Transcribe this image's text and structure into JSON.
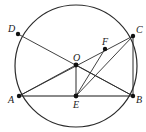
{
  "figure": {
    "canvas": {
      "width": 146,
      "height": 132
    },
    "colors": {
      "stroke": "#2b2b2b",
      "chord_ab": "#8a8a8a",
      "point_fill": "#111111",
      "label": "#1a1a1a",
      "background": "#ffffff"
    },
    "circle": {
      "name": "circumcircle",
      "cx": 76,
      "cy": 66,
      "r": 61,
      "stroke_width": 1.2
    },
    "points": [
      {
        "id": "D",
        "label": "D",
        "x": 18,
        "y": 34,
        "label_dx": -10,
        "label_dy": -10,
        "r": 2.2
      },
      {
        "id": "C",
        "label": "C",
        "x": 133,
        "y": 36,
        "label_dx": 3,
        "label_dy": -11,
        "r": 2.2
      },
      {
        "id": "F",
        "label": "F",
        "x": 105,
        "y": 49,
        "label_dx": -3,
        "label_dy": -12,
        "r": 2.2
      },
      {
        "id": "O",
        "label": "O",
        "x": 76,
        "y": 65,
        "label_dx": -3,
        "label_dy": -12,
        "r": 2.4
      },
      {
        "id": "A",
        "label": "A",
        "x": 19,
        "y": 96,
        "label_dx": -11,
        "label_dy": -1,
        "r": 2.2
      },
      {
        "id": "E",
        "label": "E",
        "x": 76,
        "y": 96,
        "label_dx": -3,
        "label_dy": 4,
        "r": 2.4
      },
      {
        "id": "B",
        "label": "B",
        "x": 133,
        "y": 96,
        "label_dx": 3,
        "label_dy": -1,
        "r": 2.2
      }
    ],
    "segments": [
      {
        "id": "AB",
        "name": "chord-a-b",
        "x1": 19,
        "y1": 96,
        "x2": 133,
        "y2": 96,
        "color": "#8a8a8a",
        "width": 1.8
      },
      {
        "id": "CB",
        "name": "chord-c-b",
        "x1": 133,
        "y1": 36,
        "x2": 133,
        "y2": 96,
        "color": "#2b2b2b",
        "width": 1.0
      },
      {
        "id": "DB",
        "name": "diagonal-d-b",
        "x1": 18,
        "y1": 34,
        "x2": 133,
        "y2": 96,
        "color": "#2b2b2b",
        "width": 0.9
      },
      {
        "id": "AC",
        "name": "diagonal-a-c",
        "x1": 19,
        "y1": 96,
        "x2": 133,
        "y2": 36,
        "color": "#2b2b2b",
        "width": 0.9
      },
      {
        "id": "OE",
        "name": "segment-o-e",
        "x1": 76,
        "y1": 65,
        "x2": 76,
        "y2": 96,
        "color": "#2b2b2b",
        "width": 1.0
      },
      {
        "id": "EF",
        "name": "segment-e-f",
        "x1": 76,
        "y1": 96,
        "x2": 105,
        "y2": 49,
        "color": "#2b2b2b",
        "width": 0.9
      },
      {
        "id": "EC",
        "name": "segment-e-c",
        "x1": 76,
        "y1": 96,
        "x2": 133,
        "y2": 36,
        "color": "#2b2b2b",
        "width": 0.9
      },
      {
        "id": "OB",
        "name": "segment-o-b",
        "x1": 76,
        "y1": 65,
        "x2": 133,
        "y2": 96,
        "color": "#2b2b2b",
        "width": 0.9
      },
      {
        "id": "AO",
        "name": "segment-a-o",
        "x1": 19,
        "y1": 96,
        "x2": 76,
        "y2": 65,
        "color": "#2b2b2b",
        "width": 0.9
      }
    ]
  }
}
